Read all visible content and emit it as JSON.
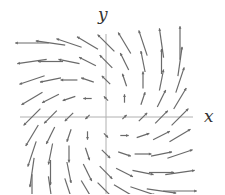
{
  "diagram": {
    "type": "vector_field",
    "axes": {
      "x_label": "x",
      "y_label": "y"
    },
    "colors": {
      "axis": "#b0b0b0",
      "arrow": "#6a6a6a",
      "background": "#ffffff"
    },
    "grid": {
      "x_values": [
        -4,
        -3,
        -2,
        -1,
        0,
        1,
        2,
        3,
        4
      ],
      "y_values": [
        -4,
        -3,
        -2,
        -1,
        0,
        1,
        2,
        3,
        4
      ]
    },
    "layout": {
      "origin_px": [
        106,
        117
      ],
      "unit_px": 18.5,
      "x_axis_px": [
        20,
        193
      ],
      "y_axis_px": [
        34,
        194
      ]
    }
  }
}
